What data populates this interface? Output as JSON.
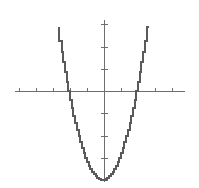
{
  "chart_data": {
    "type": "line",
    "title": "",
    "subtitle": "",
    "xlabel": "",
    "ylabel": "",
    "grid": false,
    "legend": null,
    "legend_position": "none",
    "equation": "y = x^2 - 4",
    "xlim": [
      -5.2,
      4.8
    ],
    "ylim": [
      -4.6,
      4.2
    ],
    "x_tick_values": [
      -5,
      -4,
      -3,
      -2,
      -1,
      0,
      1,
      2,
      3,
      4
    ],
    "y_tick_values": [
      -4,
      -3,
      -2,
      -1,
      0,
      1,
      2,
      3,
      4
    ],
    "tick_labels_shown": false,
    "vertex": [
      0,
      -4
    ],
    "roots": [
      -2,
      2
    ],
    "x": [
      -2.62,
      -2.5,
      -2.4,
      -2.3,
      -2.2,
      -2.1,
      -2.0,
      -1.9,
      -1.8,
      -1.7,
      -1.6,
      -1.5,
      -1.4,
      -1.3,
      -1.2,
      -1.1,
      -1.0,
      -0.9,
      -0.8,
      -0.7,
      -0.6,
      -0.5,
      -0.4,
      -0.3,
      -0.2,
      -0.1,
      0.0,
      0.1,
      0.2,
      0.3,
      0.4,
      0.5,
      0.6,
      0.7,
      0.8,
      0.9,
      1.0,
      1.1,
      1.2,
      1.3,
      1.4,
      1.5,
      1.6,
      1.7,
      1.8,
      1.9,
      2.0,
      2.1,
      2.2,
      2.3,
      2.4,
      2.5,
      2.62
    ],
    "y": [
      2.86,
      2.25,
      1.76,
      1.29,
      0.84,
      0.41,
      0.0,
      -0.39,
      -0.76,
      -1.11,
      -1.44,
      -1.75,
      -2.04,
      -2.31,
      -2.56,
      -2.79,
      -3.0,
      -3.19,
      -3.36,
      -3.51,
      -3.64,
      -3.75,
      -3.84,
      -3.91,
      -3.96,
      -3.99,
      -4.0,
      -3.99,
      -3.96,
      -3.91,
      -3.84,
      -3.75,
      -3.64,
      -3.51,
      -3.36,
      -3.19,
      -3.0,
      -2.79,
      -2.56,
      -2.31,
      -2.04,
      -1.75,
      -1.44,
      -1.11,
      -0.76,
      -0.39,
      0.0,
      0.41,
      0.84,
      1.29,
      1.76,
      2.25,
      2.86
    ],
    "series": [
      {
        "name": "parabola",
        "color": "#5a5a5a",
        "style": "stair-stepped"
      }
    ],
    "colors": {
      "background": "#ffffff",
      "axis": "#6e6e6e",
      "curve": "#5a5a5a"
    }
  },
  "geometry": {
    "x_axis_y_px": 91,
    "x_axis_start_px": 15,
    "x_axis_end_px": 185,
    "y_axis_x_px": 104,
    "y_axis_top_px": 20,
    "y_axis_bottom_px": 182,
    "px_per_unit_x": 17,
    "px_per_unit_y": 22.25,
    "tick_half_len_px": 3
  }
}
